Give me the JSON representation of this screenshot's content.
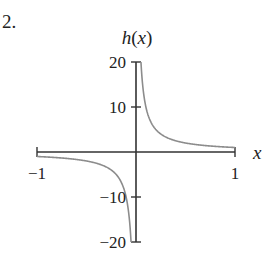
{
  "problem": {
    "number": "2."
  },
  "chart_data": {
    "type": "line",
    "title": "",
    "function": "h(x) = 1/x",
    "xlabel": "x",
    "ylabel": "h(x)",
    "xlim": [
      -1,
      1
    ],
    "ylim": [
      -20,
      20
    ],
    "x_ticks": [
      -1,
      1
    ],
    "x_tick_labels": [
      "−1",
      "1"
    ],
    "y_ticks": [
      20,
      10,
      -10,
      -20
    ],
    "y_tick_labels": [
      "20",
      "10",
      "−10",
      "−20"
    ],
    "grid": false,
    "legend": null,
    "series": [
      {
        "name": "h(x) left branch",
        "x": [
          -1,
          -0.5,
          -0.25,
          -0.1,
          -0.05
        ],
        "y": [
          -1,
          -2,
          -4,
          -10,
          -20
        ]
      },
      {
        "name": "h(x) right branch",
        "x": [
          0.05,
          0.1,
          0.25,
          0.5,
          1
        ],
        "y": [
          20,
          10,
          4,
          2,
          1
        ]
      }
    ],
    "curve_color": "#8c8c8c",
    "axis_color": "#333333"
  }
}
